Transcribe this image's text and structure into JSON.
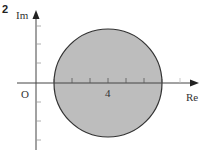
{
  "figure": {
    "question_number": "2",
    "axes": {
      "x_label": "Re",
      "y_label": "Im",
      "origin_label": "O",
      "tick_label": "4",
      "x_ticks": [
        1,
        2,
        3,
        4,
        5,
        6,
        7,
        8
      ],
      "y_ticks": [
        -3,
        -2,
        -1,
        1,
        2,
        3
      ]
    },
    "region": {
      "shape": "circle",
      "center": [
        4,
        0
      ],
      "radius": 3,
      "fill_color": "#bdbdbd",
      "stroke_color": "#333333"
    }
  }
}
